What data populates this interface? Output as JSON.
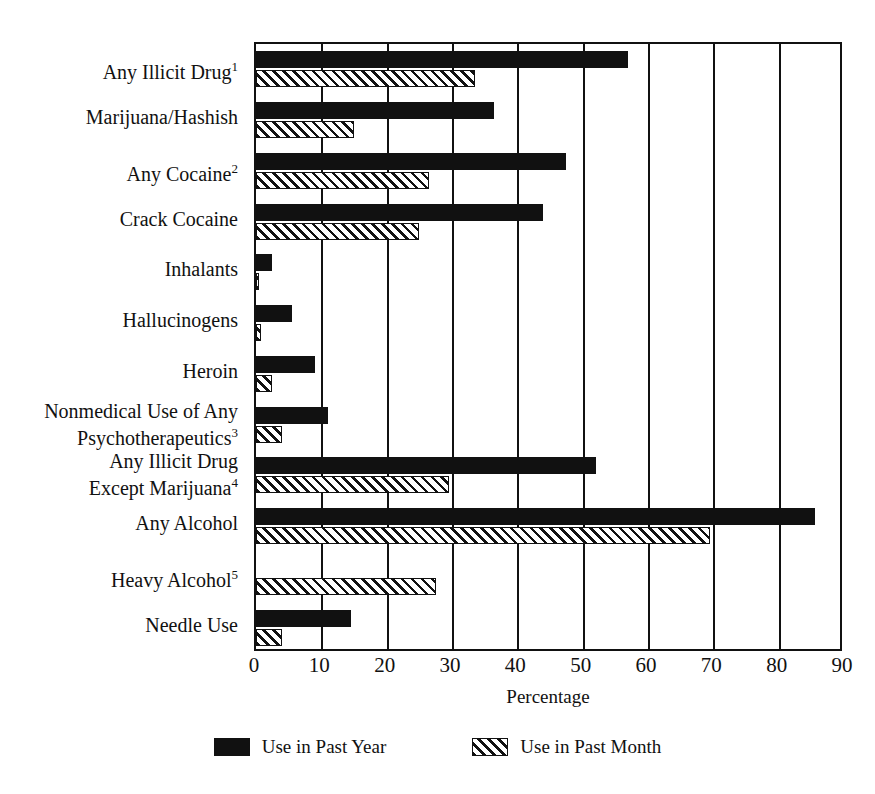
{
  "chart_data": {
    "type": "bar",
    "orientation": "horizontal",
    "title": "",
    "xlabel": "Percentage",
    "ylabel": "",
    "xlim": [
      0,
      90
    ],
    "xticks": [
      0,
      10,
      20,
      30,
      40,
      50,
      60,
      70,
      80,
      90
    ],
    "grid": true,
    "legend_position": "bottom",
    "categories": [
      "Any Illicit Drug¹",
      "Marijuana/Hashish",
      "Any Cocaine²",
      "Crack Cocaine",
      "Inhalants",
      "Hallucinogens",
      "Heroin",
      "Nonmedical Use of Any Psychotherapeutics³",
      "Any Illicit Drug Except Marijuana⁴",
      "Any Alcohol",
      "Heavy Alcohol⁵",
      "Needle Use"
    ],
    "series": [
      {
        "name": "Use in Past Year",
        "pattern": "solid",
        "values": [
          57.0,
          36.5,
          47.5,
          44.0,
          2.5,
          5.5,
          9.0,
          11.0,
          52.0,
          85.5,
          0.0,
          14.5
        ]
      },
      {
        "name": "Use in Past Month",
        "pattern": "hatched",
        "values": [
          33.5,
          15.0,
          26.5,
          25.0,
          0.5,
          0.7,
          2.5,
          4.0,
          29.5,
          69.5,
          27.5,
          4.0
        ]
      }
    ]
  },
  "axis": {
    "tick_labels": [
      "0",
      "10",
      "20",
      "30",
      "40",
      "50",
      "60",
      "70",
      "80",
      "90"
    ],
    "x_title": "Percentage"
  },
  "category_labels": [
    {
      "line1": "Any Illicit Drug",
      "sup": "1"
    },
    {
      "line1": "Marijuana/Hashish",
      "sup": ""
    },
    {
      "line1": "Any Cocaine",
      "sup": "2"
    },
    {
      "line1": "Crack Cocaine",
      "sup": ""
    },
    {
      "line1": "Inhalants",
      "sup": ""
    },
    {
      "line1": "Hallucinogens",
      "sup": ""
    },
    {
      "line1": "Heroin",
      "sup": ""
    },
    {
      "line1": "Nonmedical Use of Any",
      "line2": "Psychotherapeutics",
      "sup": "3"
    },
    {
      "line1": "Any Illicit Drug",
      "line2": "Except Marijuana",
      "sup": "4"
    },
    {
      "line1": "Any Alcohol",
      "sup": ""
    },
    {
      "line1": "Heavy Alcohol",
      "sup": "5"
    },
    {
      "line1": "Needle Use",
      "sup": ""
    }
  ],
  "legend": {
    "items": [
      {
        "label": "Use in Past Year",
        "pattern": "solid"
      },
      {
        "label": "Use in Past Month",
        "pattern": "hatched"
      }
    ]
  },
  "colors": {
    "ink": "#111111",
    "background": "#ffffff"
  }
}
